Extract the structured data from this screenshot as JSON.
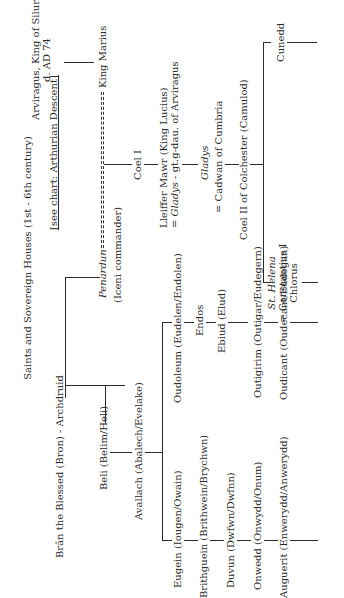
{
  "chart": {
    "title": "Saints and Sovereign Houses (1st - 6th century)",
    "see_chart_note": "[see chart: Arthurian Descent]",
    "people": {
      "bran": "Brân the Blessed (Bron) - Archdruid",
      "beli": "Beli (Belim/Heli)",
      "avallach": "Avallach (Abalech/Evelake)",
      "eugein": "Eugein (Iougen/Owain)",
      "brithguein": "Brithguein (Brithwein/Brychwn)",
      "duvun": "Duvun (Dwfwn/Dwfnn)",
      "onwedd": "Onwedd (Onwydd/Onum)",
      "auguerit": "Auguerit (Enwerydd/Anwerydd)",
      "oudoleum": "Oudoleum (Eudelen/Endolen)",
      "endos": "Endos",
      "ebiud": "Ebiud (Elud)",
      "outigirim": "Outigirim (Outigar/Eudegern)",
      "oudicant": "Oudicant (Oudecant/Eudegan)",
      "penardun": "Penardun",
      "iceni": "(Iceni commander)",
      "arviragus_line1": "Arviragus, King of Siluria",
      "arviragus_line2": "d. AD 74",
      "king_marius": "King Marius",
      "coel_i": "Coel I",
      "lleiffer_line1": "Lleiffer Mawr (King Lucius)",
      "lleiffer_line2_prefix": "= ",
      "lleiffer_line2_italic": "Gladys",
      "lleiffer_line2_suffix": " - gt.g-dau. of Arviragus",
      "gladys": "Gladys",
      "cadwan": "= Cadwan of Cumbria",
      "coel_ii": "Coel II of Colchester (Camulod)",
      "st_helena": "St. Helena",
      "constantius_line1": "= Constantius I",
      "constantius_line2": "Chlorus",
      "cunedd": "Cunedd"
    }
  }
}
